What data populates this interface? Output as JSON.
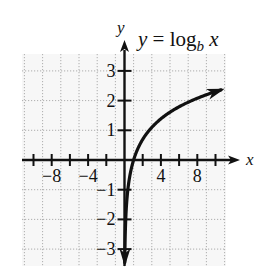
{
  "chart_data": {
    "type": "line",
    "title_parts": {
      "lhs": "y = log",
      "sub": "b",
      "rhs": " x"
    },
    "xlabel": "x",
    "ylabel": "y",
    "xlim": [
      -11,
      11
    ],
    "ylim": [
      -3.5,
      3.6
    ],
    "grid": true,
    "grid_style": "dotted",
    "x_ticks": [
      -10,
      -8,
      -6,
      -4,
      -2,
      2,
      4,
      6,
      8,
      10
    ],
    "x_tick_labels": [
      {
        "value": -8,
        "label": "−8"
      },
      {
        "value": -4,
        "label": "−4"
      },
      {
        "value": 4,
        "label": "4"
      },
      {
        "value": 8,
        "label": "8"
      }
    ],
    "y_ticks": [
      -3,
      -2,
      -1,
      1,
      2,
      3
    ],
    "y_tick_labels": [
      {
        "value": 3,
        "label": "3"
      },
      {
        "value": 2,
        "label": "2"
      },
      {
        "value": 1,
        "label": "1"
      },
      {
        "value": -1,
        "label": "−1"
      },
      {
        "value": -2,
        "label": "−2"
      },
      {
        "value": -3,
        "label": "−3"
      }
    ],
    "series": [
      {
        "name": "y = log_b x",
        "x": [
          0.05,
          0.1,
          0.2,
          0.4,
          0.7,
          1,
          1.5,
          2,
          3,
          4,
          5,
          6,
          7,
          8,
          9,
          10,
          11
        ],
        "y": [
          -3.0,
          -2.3,
          -1.61,
          -0.92,
          -0.36,
          0,
          0.41,
          0.69,
          1.1,
          1.39,
          1.61,
          1.79,
          1.95,
          2.08,
          2.2,
          2.3,
          2.4
        ]
      }
    ],
    "legend": null
  }
}
